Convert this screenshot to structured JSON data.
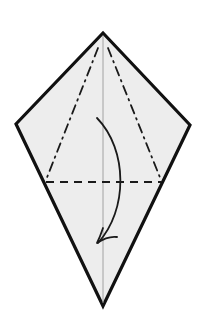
{
  "diagram": {
    "type": "origami-fold-step",
    "colors": {
      "background": "#ffffff",
      "paper_fill": "#ededed",
      "outline": "#111111",
      "center_crease": "#9a9a9a",
      "fold_lines": "#1a1a1a",
      "arrow": "#1a1a1a"
    },
    "shape": {
      "name": "kite",
      "vertices": {
        "top": [
          103,
          33
        ],
        "left": [
          16,
          124
        ],
        "right": [
          190,
          125
        ],
        "bottom": [
          103,
          306
        ]
      }
    },
    "lines": [
      {
        "name": "center-crease",
        "kind": "crease",
        "from": [
          103,
          36
        ],
        "to": [
          103,
          303
        ]
      },
      {
        "name": "left-mountain-fold",
        "kind": "mountain",
        "from": [
          98,
          48
        ],
        "to": [
          46,
          180
        ]
      },
      {
        "name": "right-mountain-fold",
        "kind": "mountain",
        "from": [
          108,
          48
        ],
        "to": [
          161,
          180
        ]
      },
      {
        "name": "horizontal-valley-fold",
        "kind": "valley",
        "from": [
          46,
          182
        ],
        "to": [
          161,
          182
        ]
      }
    ],
    "arrow": {
      "name": "fold-down-arrow",
      "start": [
        97,
        118
      ],
      "end": [
        97,
        243
      ],
      "meaning": "fold top down along valley line"
    }
  }
}
